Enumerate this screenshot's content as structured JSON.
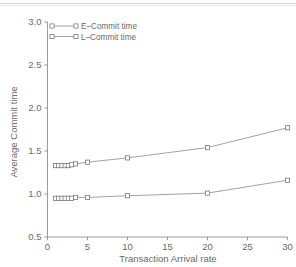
{
  "chart_data": {
    "type": "line",
    "title": "",
    "xlabel": "Transaction Arrival rate",
    "ylabel": "Average Commit time",
    "xlim": [
      0,
      30
    ],
    "ylim": [
      0.5,
      3.0
    ],
    "xticks": [
      "0",
      "5",
      "10",
      "15",
      "20",
      "25",
      "30"
    ],
    "xtick_values": [
      0,
      5,
      10,
      15,
      20,
      25,
      30
    ],
    "yticks": [
      "0.5",
      "1.0",
      "1.5",
      "2.0",
      "2.5",
      "3.0"
    ],
    "ytick_values": [
      0.5,
      1.0,
      1.5,
      2.0,
      2.5,
      3.0
    ],
    "grid": false,
    "legend_position": "upper left",
    "marker": "square",
    "series": [
      {
        "name": "L-Commit time",
        "legend_label": "L–Commit time",
        "color": "#8a8a8a",
        "x": [
          1,
          1.4,
          1.8,
          2.2,
          2.6,
          3.0,
          3.5,
          5,
          10,
          20,
          30
        ],
        "values": [
          1.33,
          1.33,
          1.33,
          1.33,
          1.33,
          1.34,
          1.35,
          1.37,
          1.42,
          1.54,
          1.77
        ]
      },
      {
        "name": "E-Commit time",
        "legend_label": "E–Commit time",
        "color": "#8a8a8a",
        "x": [
          1,
          1.4,
          1.8,
          2.2,
          2.6,
          3.0,
          3.5,
          5,
          10,
          20,
          30
        ],
        "values": [
          0.95,
          0.95,
          0.95,
          0.95,
          0.95,
          0.95,
          0.96,
          0.96,
          0.98,
          1.01,
          1.16
        ]
      }
    ],
    "legend_entries": [
      "E–Commit time",
      "L–Commit time"
    ]
  },
  "axes": {
    "x_title": "Transaction Arrival rate",
    "y_title": "Average Commit time",
    "x_tick_labels": [
      "0",
      "5",
      "10",
      "15",
      "20",
      "25",
      "30"
    ],
    "y_tick_labels": [
      "0.5",
      "1.0",
      "1.5",
      "2.0",
      "2.5",
      "3.0"
    ]
  },
  "legend": {
    "entries": [
      {
        "label": "E–Commit time"
      },
      {
        "label": "L–Commit time"
      }
    ]
  }
}
